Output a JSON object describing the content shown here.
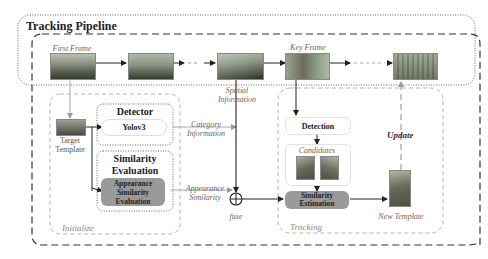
{
  "diagram": {
    "title": "Tracking Pipeline",
    "frames": {
      "first_frame": "First Frame",
      "key_frame": "Key Frame"
    },
    "initialize": {
      "label": "Initialize",
      "target_template": "Target Template",
      "detector_title": "Detector",
      "detector_model": "Yolov3",
      "similarity_title": "Similarity Evaluation",
      "appearance_box": "Appearance Similarity Evaluation"
    },
    "connectors": {
      "spatial_information": "Spatial Information",
      "category_information": "Category Information",
      "appearance_similarity": "Appearance Similarity",
      "fuse": "fuse",
      "update": "Update"
    },
    "tracking": {
      "label": "Tracking",
      "detection": "Detection",
      "candidates": "Candidates",
      "similarity_estimation": "Similarity Estimation",
      "new_template": "New Template"
    },
    "colors": {
      "gray_box": "#9a9a9a",
      "dashed": "#333333",
      "light_dash": "#b0b0b0",
      "text_italic": "#666666"
    }
  }
}
